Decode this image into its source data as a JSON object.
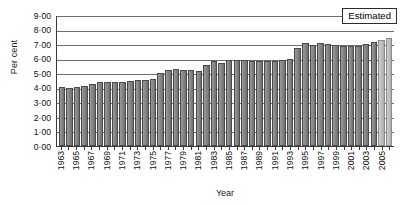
{
  "chart_data": {
    "type": "bar",
    "title": "",
    "xlabel": "Year",
    "ylabel": "Per cent",
    "ylim": [
      0,
      9
    ],
    "grid": true,
    "yticks": [
      "9·00",
      "8·00",
      "7·00",
      "6·00",
      "5·00",
      "4·00",
      "3·00",
      "2·00",
      "1·00",
      "0·00"
    ],
    "ytick_values": [
      9,
      8,
      7,
      6,
      5,
      4,
      3,
      2,
      1,
      0
    ],
    "xtick_labels": [
      "1963",
      "1965",
      "1967",
      "1969",
      "1971",
      "1973",
      "1975",
      "1977",
      "1979",
      "1981",
      "1983",
      "1985",
      "1987",
      "1989",
      "1991",
      "1993",
      "1995",
      "1997",
      "1999",
      "2001",
      "2003",
      "2005"
    ],
    "annotations": [
      {
        "text": "Estimated",
        "position": "top-right"
      }
    ],
    "legend": "none",
    "categories": [
      "1963",
      "1964",
      "1965",
      "1966",
      "1967",
      "1968",
      "1969",
      "1970",
      "1971",
      "1972",
      "1973",
      "1974",
      "1975",
      "1976",
      "1977",
      "1978",
      "1979",
      "1980",
      "1981",
      "1982",
      "1983",
      "1984",
      "1985",
      "1986",
      "1987",
      "1988",
      "1989",
      "1990",
      "1991",
      "1992",
      "1993",
      "1994",
      "1995",
      "1996",
      "1997",
      "1998",
      "1999",
      "2000",
      "2001",
      "2002",
      "2003",
      "2004",
      "2005",
      "2006"
    ],
    "values": [
      4.1,
      4.05,
      4.12,
      4.15,
      4.32,
      4.45,
      4.45,
      4.42,
      4.45,
      4.5,
      4.55,
      4.55,
      4.62,
      5.08,
      5.27,
      5.35,
      5.25,
      5.25,
      5.18,
      5.6,
      5.92,
      5.78,
      5.95,
      5.98,
      5.95,
      5.92,
      5.88,
      5.92,
      5.92,
      5.95,
      6.03,
      6.78,
      7.12,
      6.98,
      7.1,
      7.05,
      7.02,
      6.95,
      6.95,
      6.9,
      7.08,
      7.22,
      7.35,
      7.45
    ],
    "estimated_from_index": 42,
    "colors": {
      "bar": "#8b8b8b",
      "bar_border": "#4a4a4a",
      "bar_estimated": "#c2c2c2",
      "bar_estimated_border": "#8c8c8c",
      "gridline": "#6e6e6e",
      "axis": "#3a3a3a",
      "text": "#101010",
      "background": "#ffffff"
    }
  }
}
